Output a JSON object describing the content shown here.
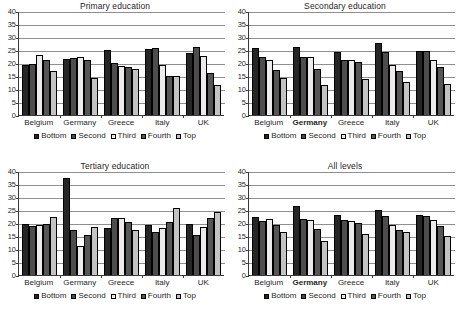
{
  "figure": {
    "series_names": [
      "Bottom",
      "Second",
      "Third",
      "Fourth",
      "Top"
    ],
    "series_colors": [
      "#262626",
      "#4d4d4d",
      "#eceaea",
      "#565656",
      "#c3c3c3"
    ],
    "categories": [
      "Belgium",
      "Germany",
      "Greece",
      "Italy",
      "UK"
    ],
    "bold_category": "Germany",
    "y_ticks": [
      "40",
      "35",
      "30",
      "25",
      "20",
      "15",
      "10",
      "5",
      "0"
    ]
  },
  "chart_data": [
    {
      "type": "bar",
      "title": "Primary education",
      "xlabel": "",
      "ylabel": "",
      "ylim": [
        0,
        40
      ],
      "yticks": [
        0,
        5,
        10,
        15,
        20,
        25,
        30,
        35,
        40
      ],
      "grid": true,
      "legend_position": "bottom",
      "categories": [
        "Belgium",
        "Germany",
        "Greece",
        "Italy",
        "UK"
      ],
      "bold_categories": [],
      "series": [
        {
          "name": "Bottom",
          "values": [
            19.3,
            21.5,
            25.0,
            25.5,
            23.8
          ]
        },
        {
          "name": "Second",
          "values": [
            19.8,
            22.0,
            20.0,
            25.7,
            26.3
          ]
        },
        {
          "name": "Third",
          "values": [
            23.0,
            22.2,
            18.8,
            19.2,
            22.6
          ]
        },
        {
          "name": "Fourth",
          "values": [
            21.2,
            21.0,
            18.6,
            15.0,
            16.2
          ]
        },
        {
          "name": "Top",
          "values": [
            16.8,
            14.3,
            17.7,
            14.9,
            11.5
          ]
        }
      ]
    },
    {
      "type": "bar",
      "title": "Secondary education",
      "xlabel": "",
      "ylabel": "",
      "ylim": [
        0,
        40
      ],
      "yticks": [
        0,
        5,
        10,
        15,
        20,
        25,
        30,
        35,
        40
      ],
      "grid": true,
      "legend_position": "bottom",
      "categories": [
        "Belgium",
        "Germany",
        "Greece",
        "Italy",
        "UK"
      ],
      "bold_categories": [
        "Germany"
      ],
      "series": [
        {
          "name": "Bottom",
          "values": [
            25.8,
            26.3,
            24.2,
            27.7,
            24.8
          ]
        },
        {
          "name": "Second",
          "values": [
            22.2,
            22.2,
            21.1,
            24.2,
            24.5
          ]
        },
        {
          "name": "Third",
          "values": [
            21.2,
            22.5,
            21.1,
            19.4,
            21.2
          ]
        },
        {
          "name": "Fourth",
          "values": [
            17.3,
            17.8,
            20.5,
            17.0,
            18.6
          ]
        },
        {
          "name": "Top",
          "values": [
            14.1,
            11.6,
            13.8,
            12.7,
            11.9
          ]
        }
      ]
    },
    {
      "type": "bar",
      "title": "Tertiary education",
      "xlabel": "",
      "ylabel": "",
      "ylim": [
        0,
        40
      ],
      "yticks": [
        0,
        5,
        10,
        15,
        20,
        25,
        30,
        35,
        40
      ],
      "grid": true,
      "legend_position": "bottom",
      "categories": [
        "Belgium",
        "Germany",
        "Greece",
        "Italy",
        "UK"
      ],
      "bold_categories": [],
      "series": [
        {
          "name": "Bottom",
          "values": [
            19.8,
            37.4,
            18.0,
            19.3,
            19.7
          ]
        },
        {
          "name": "Second",
          "values": [
            19.0,
            17.5,
            22.0,
            16.4,
            15.2
          ]
        },
        {
          "name": "Third",
          "values": [
            19.3,
            11.2,
            21.8,
            18.2,
            18.5
          ]
        },
        {
          "name": "Fourth",
          "values": [
            19.7,
            15.2,
            20.3,
            20.3,
            22.0
          ]
        },
        {
          "name": "Top",
          "values": [
            22.3,
            18.3,
            17.2,
            25.6,
            24.2
          ]
        }
      ]
    },
    {
      "type": "bar",
      "title": "All levels",
      "xlabel": "",
      "ylabel": "",
      "ylim": [
        0,
        40
      ],
      "yticks": [
        0,
        5,
        10,
        15,
        20,
        25,
        30,
        35,
        40
      ],
      "grid": true,
      "legend_position": "bottom",
      "categories": [
        "Belgium",
        "Germany",
        "Greece",
        "Italy",
        "UK"
      ],
      "bold_categories": [
        "Germany"
      ],
      "series": [
        {
          "name": "Bottom",
          "values": [
            22.3,
            26.6,
            23.1,
            25.0,
            23.1
          ]
        },
        {
          "name": "Second",
          "values": [
            20.8,
            21.4,
            21.0,
            22.6,
            22.8
          ]
        },
        {
          "name": "Third",
          "values": [
            21.4,
            21.1,
            20.8,
            19.1,
            21.2
          ]
        },
        {
          "name": "Fourth",
          "values": [
            19.2,
            17.8,
            19.9,
            17.2,
            18.7
          ]
        },
        {
          "name": "Top",
          "values": [
            16.4,
            13.0,
            15.9,
            16.4,
            15.0
          ]
        }
      ]
    }
  ]
}
